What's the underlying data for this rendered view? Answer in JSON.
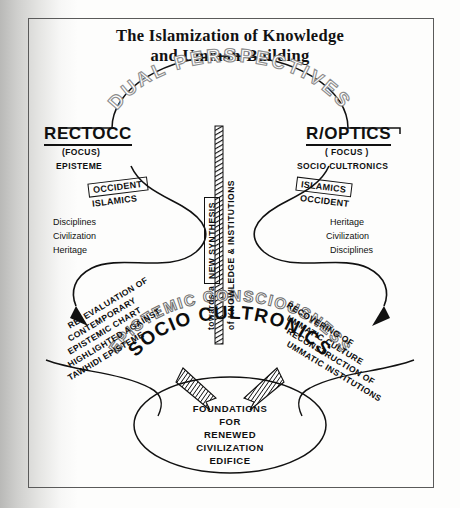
{
  "document": {
    "title_line1": "The Islamization of Knowledge",
    "title_line2": "and Ummah-Building"
  },
  "diagram": {
    "arc_top_label": "DUAL PERSPECTIVES",
    "left_branch": {
      "heading": "RECTOCC",
      "focus": "(FOCUS)",
      "mode": "EPISTEME",
      "boxed_label": "OCCIDENT",
      "under_label": "ISLAMICS",
      "list": [
        "Disciplines",
        "Civilization",
        "Heritage"
      ],
      "outcome": [
        "RE. EVALUATION OF",
        "CONTEMPORARY",
        "EPISTEMIC CHART",
        "HIGHLIGHTED AGAINST",
        "TAWHIDI EPISTEME"
      ]
    },
    "right_branch": {
      "heading": "R/OPTICS",
      "focus": "( FOCUS )",
      "mode": "SOCIO CULTRONICS",
      "boxed_label": "ISLAMICS",
      "under_label": "OCCIDENT",
      "list": [
        "Heritage",
        "Civilization",
        "Disciplines"
      ],
      "outcome": [
        "RECOVERING OF",
        "UMMATIC CULTURE",
        "RECONSTRUCTION OF",
        "UMMATIC INSTITUTIONS"
      ]
    },
    "center_axis": {
      "pre": "towards a",
      "boxed": "NEW SYNTHESIS",
      "post": "of KNOWLEDGE & INSTITUTIONS"
    },
    "lower_arcs": {
      "outer": "EPISTEMIC CONSCIOUSNESS",
      "inner": "SOCIO CULTRONICS"
    },
    "result_oval": [
      "FOUNDATIONS",
      "FOR",
      "RENEWED",
      "CIVILIZATION",
      "EDIFICE"
    ],
    "colors": {
      "ink": "#101010",
      "arc_outline": "#8c8c8c",
      "paper": "#fdfdfc",
      "frame": "#5a5a5a"
    }
  }
}
